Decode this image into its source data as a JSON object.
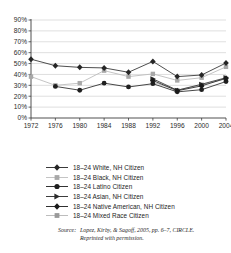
{
  "chart_data": {
    "type": "line",
    "title": "",
    "xlabel": "",
    "ylabel": "",
    "x": [
      1972,
      1976,
      1980,
      1984,
      1988,
      1992,
      1996,
      2000,
      2004
    ],
    "xticklabels": [
      "1972",
      "1976",
      "1980",
      "1984",
      "1988",
      "1992",
      "1996",
      "2000",
      "2004"
    ],
    "ylim": [
      0,
      90
    ],
    "yticklabels": [
      "0%",
      "10%",
      "20%",
      "30%",
      "40%",
      "50%",
      "60%",
      "70%",
      "80%",
      "90%"
    ],
    "yticks": [
      0,
      10,
      20,
      30,
      40,
      50,
      60,
      70,
      80,
      90
    ],
    "grid": true,
    "legend_position": "bottom",
    "series": [
      {
        "name": "18–24 White, NH Citizen",
        "marker": "diamond",
        "color": "#262626",
        "line_color": "#3a3a3a",
        "x": [
          1972,
          1976,
          1980,
          1984,
          1988,
          1992,
          1996,
          2000,
          2004
        ],
        "values": [
          54,
          48,
          46.5,
          46,
          42,
          52,
          38,
          39.5,
          50.5
        ]
      },
      {
        "name": "18–24 Black, NH Citizen",
        "marker": "square",
        "color": "#a8a8a8",
        "line_color": "#bdbdbd",
        "x": [
          1972,
          1976,
          1980,
          1984,
          1988,
          1992,
          1996,
          2000,
          2004
        ],
        "values": [
          38,
          30,
          32,
          43.5,
          38,
          40.5,
          34.5,
          37,
          47
        ]
      },
      {
        "name": "18–24 Latino Citizen",
        "marker": "circle",
        "color": "#1f1f1f",
        "line_color": "#333333",
        "x": [
          1976,
          1980,
          1984,
          1988,
          1992,
          1996,
          2000,
          2004
        ],
        "values": [
          29,
          25.5,
          32,
          28.5,
          31.5,
          24,
          26,
          33.5
        ]
      },
      {
        "name": "18–24 Asian, NH Citizen",
        "marker": "triangle",
        "color": "#2b2b2b",
        "line_color": "#3d3d3d",
        "x": [
          1992,
          1996,
          2000,
          2004
        ],
        "values": [
          36,
          25.5,
          31,
          37
        ]
      },
      {
        "name": "18–24 Native American, NH Citizen",
        "marker": "diamond",
        "color": "#1a1a1a",
        "line_color": "#303030",
        "x": [
          1992,
          1996,
          2000,
          2004
        ],
        "values": [
          34.5,
          25,
          29.5,
          36.5
        ]
      },
      {
        "name": "18–24 Mixed Race Citizen",
        "marker": "square",
        "color": "#9a9a9a",
        "line_color": "#b0b0b0",
        "x": [
          1992,
          1996,
          2000,
          2004
        ],
        "values": [
          33,
          25.5,
          30.5,
          36
        ]
      }
    ]
  },
  "legend": {
    "items": [
      {
        "label": "18–24 White, NH Citizen"
      },
      {
        "label": "18–24 Black, NH Citizen"
      },
      {
        "label": "18–24 Latino Citizen"
      },
      {
        "label": "18–24 Asian, NH Citizen"
      },
      {
        "label": "18–24 Native American, NH Citizen"
      },
      {
        "label": "18–24 Mixed Race Citizen"
      }
    ]
  },
  "source": {
    "label": "Source:",
    "line1": "Lopez, Kirby, & Sagoff, 2005, pp. 6–7, CIRCLE.",
    "line2": "Reprinted with permission."
  }
}
